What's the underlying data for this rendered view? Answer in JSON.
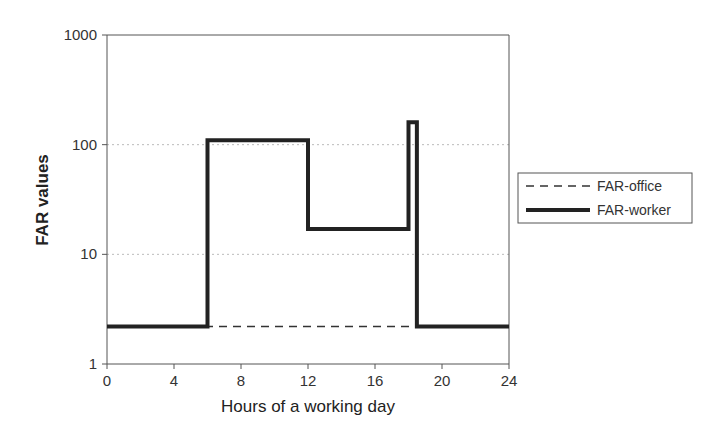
{
  "chart_data": {
    "type": "line",
    "title": "",
    "xlabel": "Hours of a working day",
    "ylabel": "FAR values",
    "xlim": [
      0,
      24
    ],
    "ylim": [
      1,
      1000
    ],
    "yscale": "log",
    "x_ticks": [
      "0",
      "4",
      "8",
      "12",
      "16",
      "20",
      "24"
    ],
    "y_ticks": [
      "1",
      "10",
      "100",
      "1000"
    ],
    "grid": "horizontal dotted at 10 and 100",
    "legend_position": "right",
    "series": [
      {
        "name": "FAR-office",
        "style": "dashed",
        "color": "#333333",
        "step_points": [
          [
            0,
            2.2
          ],
          [
            24,
            2.2
          ]
        ]
      },
      {
        "name": "FAR-worker",
        "style": "solid-thick",
        "color": "#222222",
        "step_points": [
          [
            0,
            2.2
          ],
          [
            6,
            2.2
          ],
          [
            6,
            110
          ],
          [
            12,
            110
          ],
          [
            12,
            17
          ],
          [
            18,
            17
          ],
          [
            18,
            160
          ],
          [
            18.5,
            160
          ],
          [
            18.5,
            2.2
          ],
          [
            24,
            2.2
          ]
        ]
      }
    ]
  }
}
